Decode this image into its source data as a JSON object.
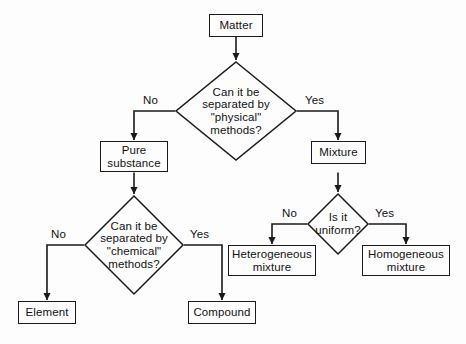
{
  "diagram": {
    "background_color": "#fdfdfd",
    "line_color": "#1a1a1a",
    "text_color": "#111111",
    "nodes": {
      "matter": {
        "label": "Matter",
        "shape": "rectangle"
      },
      "physical_decision": {
        "label": "Can it be separated by \"physical\" methods?",
        "line1": "Can it be",
        "line2": "separated by",
        "line3": "\"physical\"",
        "line4": "methods?",
        "shape": "diamond"
      },
      "pure_substance": {
        "label": "Pure substance",
        "line1": "Pure",
        "line2": "substance",
        "shape": "rectangle"
      },
      "mixture": {
        "label": "Mixture",
        "shape": "rectangle"
      },
      "chemical_decision": {
        "label": "Can it be separated by \"chemical\" methods?",
        "line1": "Can it be",
        "line2": "separated by",
        "line3": "\"chemical\"",
        "line4": "methods?",
        "shape": "diamond"
      },
      "uniform_decision": {
        "label": "Is it uniform?",
        "line1": "Is it",
        "line2": "uniform?",
        "shape": "diamond"
      },
      "element": {
        "label": "Element",
        "shape": "rectangle"
      },
      "compound": {
        "label": "Compound",
        "shape": "rectangle"
      },
      "heterogeneous": {
        "label": "Heterogeneous mixture",
        "line1": "Heterogeneous",
        "line2": "mixture",
        "shape": "rectangle"
      },
      "homogeneous": {
        "label": "Homogeneous mixture",
        "line1": "Homogeneous",
        "line2": "mixture",
        "shape": "rectangle"
      }
    },
    "edge_labels": {
      "physical_no": "No",
      "physical_yes": "Yes",
      "chemical_no": "No",
      "chemical_yes": "Yes",
      "uniform_no": "No",
      "uniform_yes": "Yes"
    }
  }
}
